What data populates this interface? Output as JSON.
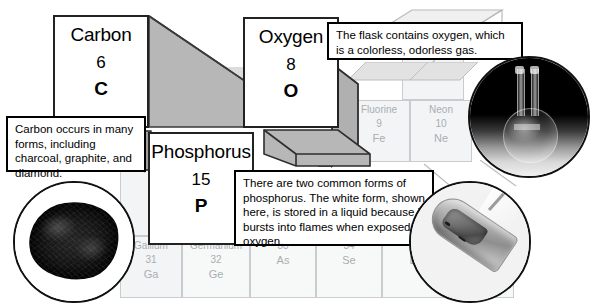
{
  "figure": {
    "background_color": "#ffffff",
    "card_border_color": "#222222",
    "grid_cell_fill": "#f3f4f5",
    "grid_text_color": "#a9aeb2"
  },
  "element_cards": [
    {
      "id": "carbon",
      "name": "Carbon",
      "number": "6",
      "symbol": "C"
    },
    {
      "id": "oxygen",
      "name": "Oxygen",
      "number": "8",
      "symbol": "O"
    },
    {
      "id": "phosphorus",
      "name": "Phosphorus",
      "number": "15",
      "symbol": "P"
    }
  ],
  "callouts": [
    {
      "id": "carbon-callout",
      "text": "Carbon occurs in many forms, including charcoal, graphite, and diamond."
    },
    {
      "id": "oxygen-callout",
      "text": "The flask contains oxygen, which is a colorless, odorless gas."
    },
    {
      "id": "phosphorus-callout",
      "text": "There are two common forms of phosphorus. The white form, shown here, is stored in a liquid because it bursts into flames when exposed to oxygen."
    }
  ],
  "photos": [
    {
      "id": "charcoal-photo",
      "alt": "charcoal-lump-photo"
    },
    {
      "id": "flask-photo",
      "alt": "round-bottom-flask-photo"
    },
    {
      "id": "testtube-photo",
      "alt": "white-phosphorus-test-tube-photo"
    }
  ],
  "background_cells": [
    {
      "id": "helium",
      "name": "",
      "number": "2",
      "symbol": "He"
    },
    {
      "id": "fluorine",
      "name": "Fluorine",
      "number": "9",
      "symbol": "Fe"
    },
    {
      "id": "neon",
      "name": "Neon",
      "number": "10",
      "symbol": "Ne"
    },
    {
      "id": "aluminum",
      "name": "Alu",
      "number": "",
      "symbol": ""
    },
    {
      "id": "gallium",
      "name": "Gallium",
      "number": "31",
      "symbol": "Ga"
    },
    {
      "id": "germanium",
      "name": "Germanium",
      "number": "32",
      "symbol": "Ge"
    },
    {
      "id": "arsenic",
      "name": "",
      "number": "33",
      "symbol": "As"
    },
    {
      "id": "selenium",
      "name": "",
      "number": "34",
      "symbol": "Se"
    },
    {
      "id": "bromine",
      "name": "",
      "number": "35",
      "symbol": "Br"
    }
  ]
}
